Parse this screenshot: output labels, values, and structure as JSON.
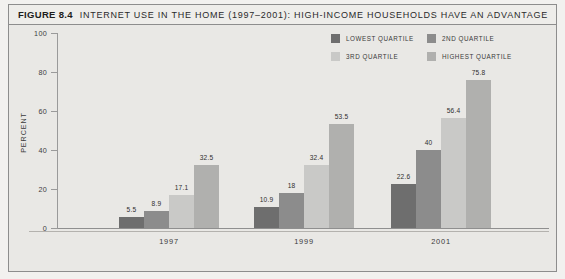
{
  "figure": {
    "number": "FIGURE 8.4",
    "title": "INTERNET USE IN THE HOME (1997–2001): HIGH-INCOME HOUSEHOLDS HAVE AN ADVANTAGE"
  },
  "colors": {
    "lowest_quartile": "#6e6e6e",
    "second_quartile": "#8c8c8c",
    "third_quartile": "#c9c9c7",
    "highest_quartile": "#b0b0ae",
    "background": "#e9e8e5",
    "frame_border": "#8d8d8d",
    "axis": "#9a9a9a"
  },
  "chart_data": {
    "type": "bar",
    "title": "INTERNET USE IN THE HOME (1997–2001): HIGH-INCOME HOUSEHOLDS HAVE AN ADVANTAGE",
    "xlabel": "",
    "ylabel": "PERCENT",
    "ylim": [
      0,
      100
    ],
    "yticks": [
      0,
      20,
      40,
      60,
      80,
      100
    ],
    "ytick_labels": [
      "0",
      "20",
      "40",
      "60",
      "80",
      "100"
    ],
    "grid": false,
    "legend_position": "top-right",
    "categories": [
      "1997",
      "1999",
      "2001"
    ],
    "series": [
      {
        "name": "LOWEST QUARTILE",
        "color": "#6e6e6e",
        "values": [
          5.5,
          10.9,
          22.6
        ],
        "labels": [
          "5.5",
          "10.9",
          "22.6"
        ]
      },
      {
        "name": "2ND QUARTILE",
        "color": "#8c8c8c",
        "values": [
          8.9,
          18.0,
          40.0
        ],
        "labels": [
          "8.9",
          "18",
          "40"
        ]
      },
      {
        "name": "3RD QUARTILE",
        "color": "#c9c9c7",
        "values": [
          17.1,
          32.4,
          56.4
        ],
        "labels": [
          "17.1",
          "32.4",
          "56.4"
        ]
      },
      {
        "name": "HIGHEST QUARTILE",
        "color": "#b0b0ae",
        "values": [
          32.5,
          53.5,
          75.8
        ],
        "labels": [
          "32.5",
          "53.5",
          "75.8"
        ]
      }
    ]
  }
}
